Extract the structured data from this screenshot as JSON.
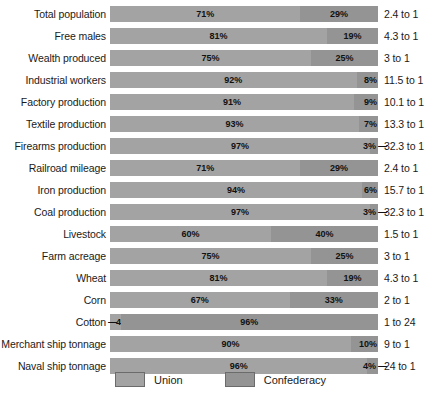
{
  "chart_data": {
    "type": "bar",
    "subtype": "stacked-horizontal-100-percent",
    "title": "",
    "xlabel": "",
    "ylabel": "",
    "xlim": [
      0,
      100
    ],
    "grid": false,
    "legend_position": "bottom-center",
    "categories": [
      "Total population",
      "Free males",
      "Wealth produced",
      "Industrial workers",
      "Factory production",
      "Textile production",
      "Firearms production",
      "Railroad mileage",
      "Iron production",
      "Coal production",
      "Livestock",
      "Farm acreage",
      "Wheat",
      "Corn",
      "Cotton",
      "Merchant ship tonnage",
      "Naval ship tonnage"
    ],
    "series": [
      {
        "name": "Union",
        "color": "#a3a3a3",
        "values": [
          71,
          81,
          75,
          92,
          91,
          93,
          97,
          71,
          94,
          97,
          60,
          75,
          81,
          67,
          4,
          90,
          96
        ]
      },
      {
        "name": "Confederacy",
        "color": "#949494",
        "values": [
          29,
          19,
          25,
          8,
          9,
          7,
          3,
          29,
          6,
          3,
          40,
          25,
          19,
          33,
          96,
          10,
          4
        ]
      }
    ],
    "annotations": [
      "2.4 to 1",
      "4.3 to 1",
      "3 to 1",
      "11.5 to 1",
      "10.1 to 1",
      "13.3 to 1",
      "32.3 to 1",
      "2.4 to 1",
      "15.7 to 1",
      "32.3 to 1",
      "1.5 to 1",
      "3 to 1",
      "4.3 to 1",
      "2 to 1",
      "1 to 24",
      "9 to 1",
      "24 to 1"
    ]
  },
  "rows": [
    {
      "label": "Total population",
      "union": 71,
      "conf": 29,
      "union_text": "71%",
      "conf_text": "29%",
      "ratio": "2.4 to 1",
      "tiny": "none"
    },
    {
      "label": "Free males",
      "union": 81,
      "conf": 19,
      "union_text": "81%",
      "conf_text": "19%",
      "ratio": "4.3 to 1",
      "tiny": "none"
    },
    {
      "label": "Wealth produced",
      "union": 75,
      "conf": 25,
      "union_text": "75%",
      "conf_text": "25%",
      "ratio": "3 to 1",
      "tiny": "none"
    },
    {
      "label": "Industrial workers",
      "union": 92,
      "conf": 8,
      "union_text": "92%",
      "conf_text": "8%",
      "ratio": "11.5 to 1",
      "tiny": "conf-inset"
    },
    {
      "label": "Factory production",
      "union": 91,
      "conf": 9,
      "union_text": "91%",
      "conf_text": "9%",
      "ratio": "10.1 to 1",
      "tiny": "conf-inset"
    },
    {
      "label": "Textile production",
      "union": 93,
      "conf": 7,
      "union_text": "93%",
      "conf_text": "7%",
      "ratio": "13.3 to 1",
      "tiny": "conf-inset"
    },
    {
      "label": "Firearms production",
      "union": 97,
      "conf": 3,
      "union_text": "97%",
      "conf_text": "3%",
      "ratio": "32.3 to 1",
      "tiny": "conf-leader"
    },
    {
      "label": "Railroad mileage",
      "union": 71,
      "conf": 29,
      "union_text": "71%",
      "conf_text": "29%",
      "ratio": "2.4 to 1",
      "tiny": "none"
    },
    {
      "label": "Iron production",
      "union": 94,
      "conf": 6,
      "union_text": "94%",
      "conf_text": "6%",
      "ratio": "15.7 to 1",
      "tiny": "conf-inset"
    },
    {
      "label": "Coal production",
      "union": 97,
      "conf": 3,
      "union_text": "97%",
      "conf_text": "3%",
      "ratio": "32.3 to 1",
      "tiny": "conf-leader"
    },
    {
      "label": "Livestock",
      "union": 60,
      "conf": 40,
      "union_text": "60%",
      "conf_text": "40%",
      "ratio": "1.5 to 1",
      "tiny": "none"
    },
    {
      "label": "Farm acreage",
      "union": 75,
      "conf": 25,
      "union_text": "75%",
      "conf_text": "25%",
      "ratio": "3 to 1",
      "tiny": "none"
    },
    {
      "label": "Wheat",
      "union": 81,
      "conf": 19,
      "union_text": "81%",
      "conf_text": "19%",
      "ratio": "4.3 to 1",
      "tiny": "none"
    },
    {
      "label": "Corn",
      "union": 67,
      "conf": 33,
      "union_text": "67%",
      "conf_text": "33%",
      "ratio": "2 to 1",
      "tiny": "none"
    },
    {
      "label": "Cotton",
      "union": 4,
      "conf": 96,
      "union_text": "4%",
      "conf_text": "96%",
      "ratio": "1 to 24",
      "tiny": "union-leader"
    },
    {
      "label": "Merchant ship tonnage",
      "union": 90,
      "conf": 10,
      "union_text": "90%",
      "conf_text": "10%",
      "ratio": "9 to 1",
      "tiny": "conf-inset"
    },
    {
      "label": "Naval ship tonnage",
      "union": 96,
      "conf": 4,
      "union_text": "96%",
      "conf_text": "4%",
      "ratio": "24 to 1",
      "tiny": "conf-leader"
    }
  ],
  "legend": {
    "items": [
      {
        "label": "Union",
        "color": "#a3a3a3"
      },
      {
        "label": "Confederacy",
        "color": "#949494"
      }
    ]
  },
  "leader_dash": "—"
}
